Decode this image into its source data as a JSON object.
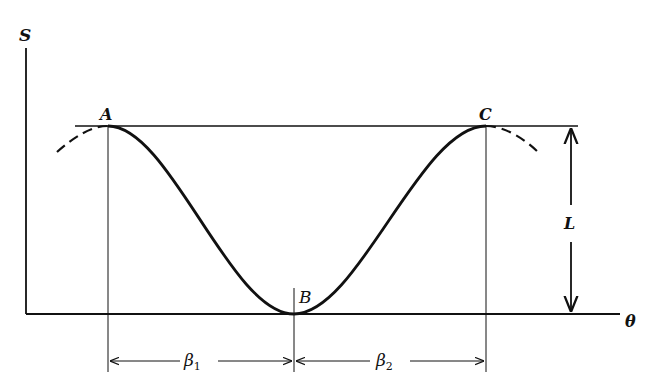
{
  "diagram": {
    "type": "periodic-curve-with-dimensions",
    "axes": {
      "y_label": "S",
      "x_label": "θ"
    },
    "points": [
      {
        "name": "A",
        "role": "maximum"
      },
      {
        "name": "B",
        "role": "minimum"
      },
      {
        "name": "C",
        "role": "maximum"
      }
    ],
    "dimensions": {
      "height_label": "L",
      "span1_label": "β",
      "span1_sub": "1",
      "span2_label": "β",
      "span2_sub": "2"
    },
    "colors": {
      "ink": "#111111",
      "background": "#ffffff"
    }
  }
}
